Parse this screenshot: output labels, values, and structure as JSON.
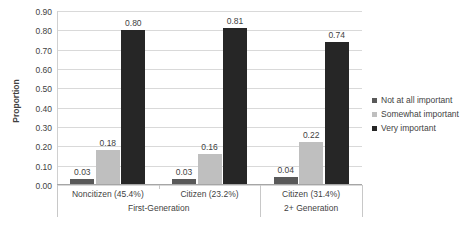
{
  "chart_data": {
    "type": "bar",
    "title": "",
    "xlabel": "",
    "ylabel": "Proportion",
    "ylim": [
      0.0,
      0.9
    ],
    "ytick_step": 0.1,
    "grid": true,
    "legend_position": "right",
    "categories": [
      "Noncitizen (45.4%)",
      "Citizen (23.2%)",
      "Citizen (31.4%)"
    ],
    "category_groups": [
      {
        "label": "First-Generation",
        "categories": [
          "Noncitizen (45.4%)",
          "Citizen (23.2%)"
        ]
      },
      {
        "label": "2+ Generation",
        "categories": [
          "Citizen (31.4%)"
        ]
      }
    ],
    "series": [
      {
        "name": "Not at all important",
        "color": "#595959",
        "values": [
          0.03,
          0.03,
          0.04
        ]
      },
      {
        "name": "Somewhat important",
        "color": "#bfbfbf",
        "values": [
          0.18,
          0.16,
          0.22
        ]
      },
      {
        "name": "Very important",
        "color": "#262626",
        "values": [
          0.8,
          0.81,
          0.74
        ]
      }
    ],
    "ytick_labels": [
      "0.00",
      "0.10",
      "0.20",
      "0.30",
      "0.40",
      "0.50",
      "0.60",
      "0.70",
      "0.80",
      "0.90"
    ],
    "data_labels": [
      [
        "0.03",
        "0.18",
        "0.80"
      ],
      [
        "0.03",
        "0.16",
        "0.81"
      ],
      [
        "0.04",
        "0.22",
        "0.74"
      ]
    ]
  },
  "axis": {
    "y_title": "Proportion"
  },
  "legend": {
    "items": [
      {
        "label": "Not at all important",
        "color": "#595959"
      },
      {
        "label": "Somewhat important",
        "color": "#bfbfbf"
      },
      {
        "label": "Very important",
        "color": "#262626"
      }
    ]
  }
}
